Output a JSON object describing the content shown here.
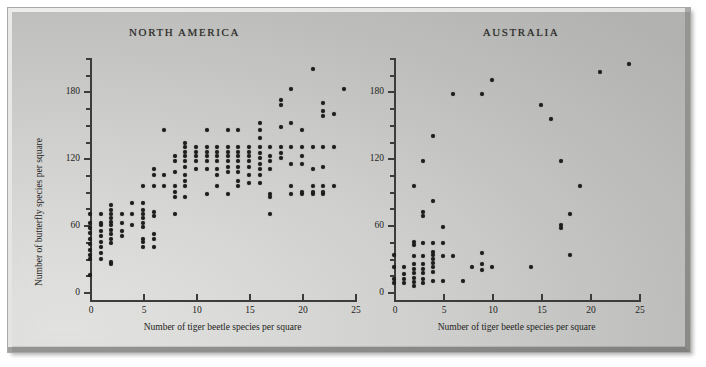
{
  "figure": {
    "background_color": "#cfcfcd",
    "ink_color": "#1d1d1b",
    "panels": [
      {
        "key": "north_america",
        "title": "NORTH AMERICA",
        "xlabel": "Number of tiger beetle species per square",
        "ylabel": "Number of butterfly species per square"
      },
      {
        "key": "australia",
        "title": "AUSTRALIA",
        "xlabel": "Number of tiger beetle species per square",
        "ylabel": ""
      }
    ]
  },
  "chart_data": [
    {
      "type": "scatter",
      "title": "NORTH AMERICA",
      "xlabel": "Number of tiger beetle species per square",
      "ylabel": "Number of butterfly species per square",
      "xlim": [
        0,
        25
      ],
      "ylim": [
        0,
        210
      ],
      "xticks": [
        0,
        5,
        10,
        15,
        20,
        25
      ],
      "yticks": [
        0,
        60,
        120,
        180
      ],
      "yminorticks": [
        15,
        30,
        45,
        75,
        90,
        105,
        135,
        150,
        165,
        195,
        210
      ],
      "grid": false,
      "legend": false,
      "marker": "filled-circle",
      "points": [
        [
          0,
          15
        ],
        [
          0,
          30
        ],
        [
          0,
          33
        ],
        [
          0,
          38
        ],
        [
          0,
          43
        ],
        [
          0,
          48
        ],
        [
          0,
          53
        ],
        [
          0,
          57
        ],
        [
          0,
          62
        ],
        [
          0,
          70
        ],
        [
          1,
          30
        ],
        [
          1,
          35
        ],
        [
          1,
          40
        ],
        [
          1,
          45
        ],
        [
          1,
          50
        ],
        [
          1,
          55
        ],
        [
          1,
          60
        ],
        [
          1,
          62
        ],
        [
          1,
          70
        ],
        [
          2,
          25
        ],
        [
          2,
          27
        ],
        [
          2,
          44
        ],
        [
          2,
          48
        ],
        [
          2,
          52
        ],
        [
          2,
          56
        ],
        [
          2,
          60
        ],
        [
          2,
          63
        ],
        [
          2,
          66
        ],
        [
          2,
          70
        ],
        [
          2,
          74
        ],
        [
          2,
          78
        ],
        [
          3,
          50
        ],
        [
          3,
          55
        ],
        [
          3,
          62
        ],
        [
          3,
          70
        ],
        [
          4,
          60
        ],
        [
          4,
          70
        ],
        [
          4,
          80
        ],
        [
          5,
          40
        ],
        [
          5,
          45
        ],
        [
          5,
          48
        ],
        [
          5,
          58
        ],
        [
          5,
          62
        ],
        [
          5,
          66
        ],
        [
          5,
          70
        ],
        [
          5,
          74
        ],
        [
          5,
          80
        ],
        [
          5,
          95
        ],
        [
          6,
          40
        ],
        [
          6,
          48
        ],
        [
          6,
          52
        ],
        [
          6,
          68
        ],
        [
          6,
          72
        ],
        [
          6,
          95
        ],
        [
          6,
          105
        ],
        [
          6,
          110
        ],
        [
          7,
          95
        ],
        [
          7,
          105
        ],
        [
          7,
          145
        ],
        [
          8,
          70
        ],
        [
          8,
          85
        ],
        [
          8,
          90
        ],
        [
          8,
          95
        ],
        [
          8,
          108
        ],
        [
          8,
          118
        ],
        [
          8,
          122
        ],
        [
          9,
          85
        ],
        [
          9,
          95
        ],
        [
          9,
          100
        ],
        [
          9,
          105
        ],
        [
          9,
          112
        ],
        [
          9,
          118
        ],
        [
          9,
          122
        ],
        [
          9,
          126
        ],
        [
          9,
          130
        ],
        [
          9,
          134
        ],
        [
          10,
          110
        ],
        [
          10,
          118
        ],
        [
          10,
          122
        ],
        [
          10,
          126
        ],
        [
          10,
          130
        ],
        [
          11,
          88
        ],
        [
          11,
          110
        ],
        [
          11,
          118
        ],
        [
          11,
          122
        ],
        [
          11,
          126
        ],
        [
          11,
          130
        ],
        [
          11,
          145
        ],
        [
          12,
          95
        ],
        [
          12,
          105
        ],
        [
          12,
          110
        ],
        [
          12,
          118
        ],
        [
          12,
          122
        ],
        [
          12,
          126
        ],
        [
          12,
          130
        ],
        [
          13,
          88
        ],
        [
          13,
          108
        ],
        [
          13,
          112
        ],
        [
          13,
          118
        ],
        [
          13,
          122
        ],
        [
          13,
          126
        ],
        [
          13,
          130
        ],
        [
          13,
          145
        ],
        [
          14,
          95
        ],
        [
          14,
          100
        ],
        [
          14,
          108
        ],
        [
          14,
          112
        ],
        [
          14,
          118
        ],
        [
          14,
          122
        ],
        [
          14,
          126
        ],
        [
          14,
          130
        ],
        [
          14,
          145
        ],
        [
          15,
          98
        ],
        [
          15,
          105
        ],
        [
          15,
          112
        ],
        [
          15,
          118
        ],
        [
          15,
          122
        ],
        [
          15,
          126
        ],
        [
          15,
          130
        ],
        [
          16,
          98
        ],
        [
          16,
          105
        ],
        [
          16,
          110
        ],
        [
          16,
          115
        ],
        [
          16,
          120
        ],
        [
          16,
          125
        ],
        [
          16,
          130
        ],
        [
          16,
          138
        ],
        [
          16,
          145
        ],
        [
          16,
          152
        ],
        [
          17,
          70
        ],
        [
          17,
          85
        ],
        [
          17,
          88
        ],
        [
          17,
          110
        ],
        [
          17,
          118
        ],
        [
          17,
          122
        ],
        [
          17,
          130
        ],
        [
          18,
          120
        ],
        [
          18,
          125
        ],
        [
          18,
          130
        ],
        [
          18,
          148
        ],
        [
          18,
          168
        ],
        [
          18,
          172
        ],
        [
          19,
          88
        ],
        [
          19,
          95
        ],
        [
          19,
          115
        ],
        [
          19,
          130
        ],
        [
          19,
          152
        ],
        [
          19,
          182
        ],
        [
          20,
          88
        ],
        [
          20,
          90
        ],
        [
          20,
          115
        ],
        [
          20,
          122
        ],
        [
          20,
          130
        ],
        [
          20,
          145
        ],
        [
          21,
          88
        ],
        [
          21,
          90
        ],
        [
          21,
          95
        ],
        [
          21,
          110
        ],
        [
          21,
          130
        ],
        [
          21,
          200
        ],
        [
          22,
          88
        ],
        [
          22,
          90
        ],
        [
          22,
          95
        ],
        [
          22,
          112
        ],
        [
          22,
          130
        ],
        [
          22,
          158
        ],
        [
          22,
          162
        ],
        [
          22,
          170
        ],
        [
          23,
          95
        ],
        [
          23,
          130
        ],
        [
          23,
          160
        ],
        [
          24,
          182
        ]
      ]
    },
    {
      "type": "scatter",
      "title": "AUSTRALIA",
      "xlabel": "Number of tiger beetle species per square",
      "ylabel": "",
      "xlim": [
        0,
        25
      ],
      "ylim": [
        0,
        210
      ],
      "xticks": [
        0,
        5,
        10,
        15,
        20,
        25
      ],
      "yticks": [
        0,
        60,
        120,
        180
      ],
      "yminorticks": [
        15,
        30,
        45,
        75,
        90,
        105,
        135,
        150,
        165,
        195,
        210
      ],
      "grid": false,
      "legend": false,
      "marker": "filled-circle",
      "points": [
        [
          0,
          8
        ],
        [
          0,
          12
        ],
        [
          0,
          22
        ],
        [
          0,
          33
        ],
        [
          1,
          8
        ],
        [
          1,
          12
        ],
        [
          1,
          16
        ],
        [
          1,
          22
        ],
        [
          2,
          5
        ],
        [
          2,
          9
        ],
        [
          2,
          13
        ],
        [
          2,
          17
        ],
        [
          2,
          21
        ],
        [
          2,
          25
        ],
        [
          2,
          32
        ],
        [
          2,
          42
        ],
        [
          2,
          45
        ],
        [
          2,
          95
        ],
        [
          3,
          8
        ],
        [
          3,
          12
        ],
        [
          3,
          17
        ],
        [
          3,
          21
        ],
        [
          3,
          25
        ],
        [
          3,
          32
        ],
        [
          3,
          44
        ],
        [
          3,
          68
        ],
        [
          3,
          72
        ],
        [
          3,
          118
        ],
        [
          4,
          10
        ],
        [
          4,
          18
        ],
        [
          4,
          22
        ],
        [
          4,
          26
        ],
        [
          4,
          30
        ],
        [
          4,
          33
        ],
        [
          4,
          36
        ],
        [
          4,
          44
        ],
        [
          4,
          82
        ],
        [
          4,
          140
        ],
        [
          5,
          10
        ],
        [
          5,
          32
        ],
        [
          5,
          44
        ],
        [
          5,
          58
        ],
        [
          6,
          32
        ],
        [
          6,
          178
        ],
        [
          7,
          10
        ],
        [
          8,
          22
        ],
        [
          9,
          20
        ],
        [
          9,
          25
        ],
        [
          9,
          35
        ],
        [
          9,
          178
        ],
        [
          10,
          22
        ],
        [
          10,
          190
        ],
        [
          14,
          22
        ],
        [
          15,
          168
        ],
        [
          16,
          155
        ],
        [
          17,
          57
        ],
        [
          17,
          60
        ],
        [
          17,
          118
        ],
        [
          18,
          33
        ],
        [
          18,
          70
        ],
        [
          19,
          95
        ],
        [
          21,
          197
        ],
        [
          24,
          205
        ]
      ]
    }
  ]
}
